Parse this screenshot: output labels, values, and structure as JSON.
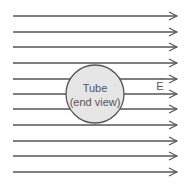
{
  "diagram": {
    "field": {
      "label": "E",
      "vector_symbol": "→",
      "direction": "right",
      "line_count": 11,
      "line_y": [
        16,
        32,
        47,
        63,
        79,
        94,
        109,
        125,
        141,
        156,
        172
      ],
      "x_start": 13,
      "x_end": 177,
      "color": "#555555"
    },
    "tube": {
      "title": "Tube",
      "subtitle": "(end view)",
      "cx": 95,
      "cy": 94,
      "r": 29,
      "fill": "#e6e6e6",
      "stroke": "#555555"
    }
  }
}
